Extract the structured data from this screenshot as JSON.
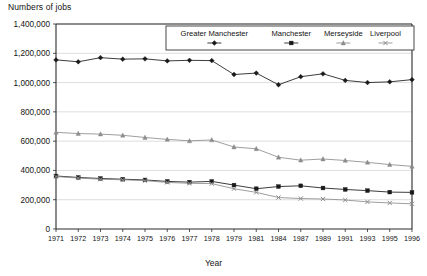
{
  "chart_data": {
    "type": "line",
    "title": "",
    "ylabel": "Numbers of jobs",
    "xlabel": "Year",
    "ylim": [
      0,
      1400000
    ],
    "grid": true,
    "legend_position": "top-right-inside",
    "categories": [
      "1971",
      "1972",
      "1973",
      "1974",
      "1975",
      "1976",
      "1977",
      "1978",
      "1979",
      "1981",
      "1984",
      "1987",
      "1989",
      "1991",
      "1993",
      "1995",
      "1996"
    ],
    "ytick_labels": [
      "0",
      "200,000",
      "400,000",
      "600,000",
      "800,000",
      "1,000,000",
      "1,200,000",
      "1,400,000"
    ],
    "ytick_values": [
      0,
      200000,
      400000,
      600000,
      800000,
      1000000,
      1200000,
      1400000
    ],
    "series": [
      {
        "name": "Greater Manchester",
        "marker": "diamond",
        "color": "#1a1a1a",
        "values": [
          1155000,
          1142000,
          1170000,
          1160000,
          1162000,
          1148000,
          1152000,
          1150000,
          1055000,
          1065000,
          985000,
          1040000,
          1060000,
          1015000,
          1000000,
          1005000,
          1020000
        ]
      },
      {
        "name": "Manchester",
        "marker": "square",
        "color": "#1a1a1a",
        "values": [
          362000,
          352000,
          345000,
          340000,
          335000,
          325000,
          320000,
          325000,
          300000,
          275000,
          290000,
          295000,
          280000,
          270000,
          262000,
          252000,
          250000
        ]
      },
      {
        "name": "Merseyside",
        "marker": "triangle",
        "color": "#8c8c8c",
        "values": [
          660000,
          652000,
          648000,
          640000,
          625000,
          612000,
          602000,
          608000,
          560000,
          548000,
          490000,
          470000,
          478000,
          468000,
          455000,
          440000,
          428000
        ]
      },
      {
        "name": "Liverpool",
        "marker": "cross",
        "color": "#8c8c8c",
        "values": [
          358000,
          348000,
          340000,
          336000,
          330000,
          318000,
          312000,
          310000,
          275000,
          250000,
          215000,
          208000,
          205000,
          198000,
          185000,
          178000,
          172000
        ]
      }
    ]
  }
}
